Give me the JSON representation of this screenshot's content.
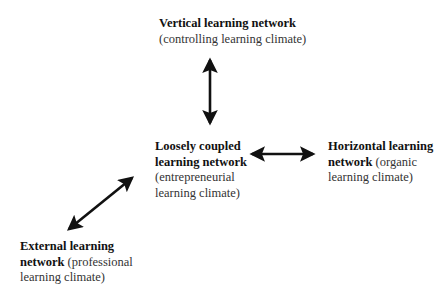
{
  "nodes": {
    "vertical": {
      "title": "Vertical learning network",
      "subtitle": "(controlling learning climate)"
    },
    "loosely": {
      "title_line1": "Loosely coupled",
      "title_line2": "learning network",
      "subtitle_line1": "(entrepreneurial",
      "subtitle_line2": "learning climate)"
    },
    "horizontal": {
      "title_line1": "Horizontal learning",
      "title_line2": "network",
      "subtitle_inline": " (organic",
      "subtitle_line2": "learning climate)"
    },
    "external": {
      "title_line1": "External learning",
      "title_line2": "network",
      "subtitle_inline": " (professional",
      "subtitle_line2": "learning climate)"
    }
  },
  "edges": [
    {
      "from": "loosely",
      "to": "vertical",
      "type": "bidirectional"
    },
    {
      "from": "loosely",
      "to": "horizontal",
      "type": "bidirectional"
    },
    {
      "from": "loosely",
      "to": "external",
      "type": "bidirectional"
    }
  ]
}
